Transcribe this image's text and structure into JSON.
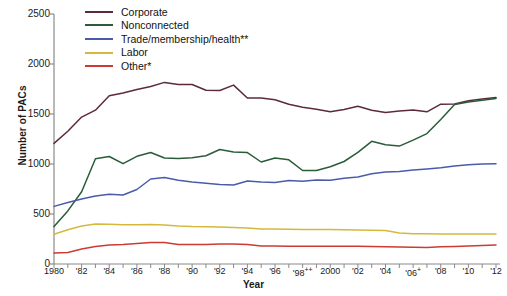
{
  "chart_data": {
    "type": "line",
    "title": "",
    "xlabel": "Year",
    "ylabel": "Number of PACs",
    "ylim": [
      0,
      2500
    ],
    "yticks": [
      0,
      500,
      1000,
      1500,
      2000,
      2500
    ],
    "xlim": [
      1980,
      2012
    ],
    "grid": false,
    "legend_position": "top-left",
    "x": [
      1980,
      1981,
      1982,
      1983,
      1984,
      1985,
      1986,
      1987,
      1988,
      1989,
      1990,
      1991,
      1992,
      1993,
      1994,
      1995,
      1996,
      1997,
      1998,
      1999,
      2000,
      2001,
      2002,
      2003,
      2004,
      2005,
      2006,
      2007,
      2008,
      2009,
      2010,
      2011,
      2012
    ],
    "xtick_labels": [
      "1980",
      "'82",
      "'84",
      "'86",
      "'88",
      "'90",
      "'92",
      "'94",
      "'96",
      "'98++",
      "2000",
      "'02",
      "'04",
      "'06+",
      "'08",
      "'10",
      "'12"
    ],
    "xtick_values": [
      1980,
      1982,
      1984,
      1986,
      1988,
      1990,
      1992,
      1994,
      1996,
      1998,
      2000,
      2002,
      2004,
      2006,
      2008,
      2010,
      2012
    ],
    "series": [
      {
        "name": "Corporate",
        "color": "#5b2b3d",
        "values": [
          1206,
          1327,
          1469,
          1538,
          1682,
          1710,
          1744,
          1775,
          1816,
          1796,
          1795,
          1738,
          1735,
          1789,
          1660,
          1660,
          1642,
          1597,
          1567,
          1548,
          1523,
          1545,
          1578,
          1538,
          1515,
          1530,
          1539,
          1522,
          1598,
          1600,
          1632,
          1651,
          1665
        ]
      },
      {
        "name": "Nonconnected",
        "color": "#2a5c38",
        "values": [
          374,
          531,
          723,
          1053,
          1075,
          1003,
          1077,
          1115,
          1060,
          1055,
          1062,
          1083,
          1145,
          1121,
          1114,
          1020,
          1060,
          1042,
          935,
          935,
          972,
          1025,
          1116,
          1227,
          1192,
          1179,
          1239,
          1304,
          1445,
          1594,
          1621,
          1638,
          1655
        ]
      },
      {
        "name": "Trade/membership/health**",
        "color": "#4a5bab",
        "values": [
          576,
          615,
          651,
          680,
          698,
          690,
          745,
          850,
          866,
          837,
          819,
          807,
          795,
          790,
          830,
          819,
          816,
          835,
          827,
          841,
          838,
          858,
          870,
          902,
          920,
          926,
          940,
          950,
          962,
          980,
          992,
          999,
          1002
        ]
      },
      {
        "name": "Labor",
        "color": "#d4b93c",
        "values": [
          297,
          342,
          380,
          399,
          398,
          393,
          392,
          395,
          390,
          380,
          374,
          372,
          370,
          365,
          360,
          351,
          349,
          347,
          346,
          345,
          344,
          342,
          340,
          338,
          335,
          310,
          303,
          302,
          301,
          300,
          300,
          300,
          300
        ]
      },
      {
        "name": "Other*",
        "color": "#cc3b33",
        "values": [
          110,
          115,
          150,
          175,
          190,
          195,
          205,
          215,
          215,
          196,
          195,
          196,
          200,
          200,
          196,
          180,
          180,
          178,
          178,
          178,
          178,
          178,
          178,
          175,
          172,
          170,
          167,
          165,
          172,
          176,
          180,
          186,
          190
        ]
      }
    ]
  }
}
